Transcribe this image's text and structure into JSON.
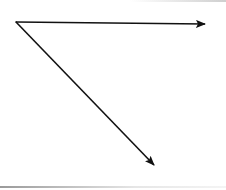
{
  "diagram": {
    "type": "angle-rays",
    "stroke_color": "#111111",
    "vertex": {
      "x": 16,
      "y": 22
    },
    "rays": [
      {
        "name": "horizontal-ray",
        "from": {
          "x": 16,
          "y": 22
        },
        "to": {
          "x": 205,
          "y": 24
        }
      },
      {
        "name": "diagonal-ray",
        "from": {
          "x": 16,
          "y": 22
        },
        "to": {
          "x": 154,
          "y": 165
        }
      }
    ],
    "labels": []
  }
}
